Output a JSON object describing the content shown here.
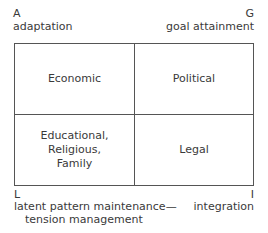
{
  "corners": {
    "top_left": {
      "letter": "A",
      "label": "adaptation"
    },
    "top_right": {
      "letter": "G",
      "label": "goal attainment"
    },
    "bottom_left": {
      "letter": "L",
      "label_line1": "latent pattern maintenance—",
      "label_line2": "tension management"
    },
    "bottom_right": {
      "letter": "I",
      "label": "integration"
    }
  },
  "cells": {
    "top_left": "Economic",
    "top_right": "Political",
    "bottom_left_lines": [
      "Educational,",
      "Religious,",
      "Family"
    ],
    "bottom_right": "Legal"
  }
}
